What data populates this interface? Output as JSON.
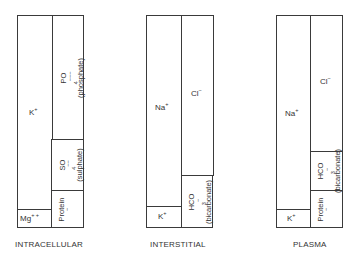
{
  "diagram": {
    "type": "ionic composition of body fluid compartments (stacked column blocks)",
    "compartments": [
      {
        "name": "INTRACELLULAR",
        "cations": [
          {
            "ion": "K",
            "charge": "+",
            "label": "K+"
          },
          {
            "ion": "Mg",
            "charge": "++",
            "label": "Mg++"
          }
        ],
        "anions": [
          {
            "ion": "PO4",
            "charge": "---",
            "label": "PO4---",
            "note": "(phosphate)"
          },
          {
            "ion": "SO4",
            "charge": "--",
            "label": "SO4--",
            "note": "(sulphate)"
          },
          {
            "ion": "Protein",
            "charge": "-",
            "label": "Protein-"
          }
        ]
      },
      {
        "name": "INTERSTITIAL",
        "cations": [
          {
            "ion": "Na",
            "charge": "+",
            "label": "Na+"
          },
          {
            "ion": "K",
            "charge": "+",
            "label": "K+"
          }
        ],
        "anions": [
          {
            "ion": "Cl",
            "charge": "-",
            "label": "Cl-"
          },
          {
            "ion": "HCO3",
            "charge": "-",
            "label": "HCO3-",
            "note": "(bicarbonate)"
          }
        ]
      },
      {
        "name": "PLASMA",
        "cations": [
          {
            "ion": "Na",
            "charge": "+",
            "label": "Na+"
          },
          {
            "ion": "K",
            "charge": "+",
            "label": "K+"
          }
        ],
        "anions": [
          {
            "ion": "Cl",
            "charge": "-",
            "label": "Cl-"
          },
          {
            "ion": "HCO3",
            "charge": "-",
            "label": "HCO3-",
            "note": "(bicarbonate)"
          },
          {
            "ion": "Protein",
            "charge": "-",
            "label": "Protein-"
          }
        ]
      }
    ]
  },
  "text": {
    "ic": {
      "k": "K",
      "k_sup": "+",
      "mg": "Mg",
      "mg_sup": "+ +",
      "po4": "PO",
      "po4_sub": "4",
      "po4_sup": "−−−",
      "po4_note": "(phosphate)",
      "so4": "SO",
      "so4_sub": "4",
      "so4_sup": "−−",
      "so4_note": "(sulphate)",
      "protein": "Protein",
      "protein_sup": "−",
      "caption": "INTRACELLULAR"
    },
    "is": {
      "na": "Na",
      "na_sup": "+",
      "k": "K",
      "k_sup": "+",
      "cl": "Cl",
      "cl_sup": "−",
      "hco3": "HCO",
      "hco3_sub": "3",
      "hco3_sup": "−",
      "hco3_note": "(bicarbonate)",
      "caption": "INTERSTITIAL"
    },
    "pl": {
      "na": "Na",
      "na_sup": "+",
      "k": "K",
      "k_sup": "+",
      "cl": "Cl",
      "cl_sup": "−",
      "hco3": "HCO",
      "hco3_sub": "3",
      "hco3_sup": "−",
      "hco3_note": "(bicarbonate)",
      "protein": "Protein",
      "protein_sup": "−",
      "caption": "PLASMA"
    }
  },
  "colors": {
    "line": "#3a3a3a",
    "text": "#333333",
    "background": "#ffffff"
  }
}
